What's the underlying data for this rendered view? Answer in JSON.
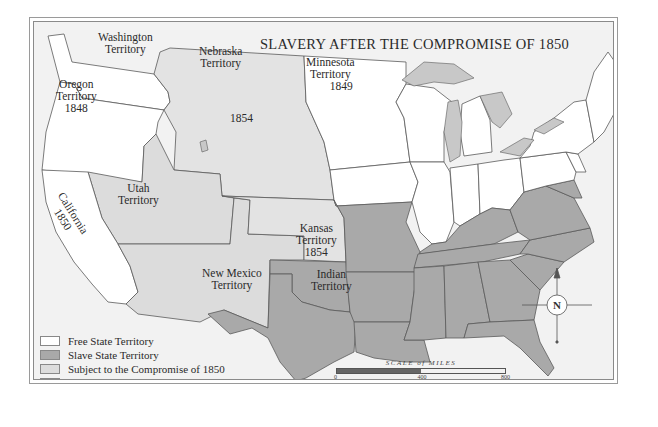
{
  "map": {
    "title": "SLAVERY AFTER THE COMPROMISE OF 1850",
    "colors": {
      "free": "#ffffff",
      "slave": "#a9a9a9",
      "compromise": "#dcdcdc",
      "kansas_nebraska": "#e3e3e3",
      "water": "#f2f2f2",
      "lakes": "#c8c8c8",
      "border": "#5a5a5a"
    },
    "regions": {
      "washington": {
        "name": "Washington",
        "suffix": "Territory"
      },
      "oregon": {
        "name": "Oregon",
        "suffix": "Territory",
        "year": "1848"
      },
      "nebraska": {
        "name": "Nebraska",
        "suffix": "Territory",
        "year": "1854"
      },
      "minnesota": {
        "name": "Minnesota",
        "suffix": "Territory",
        "year": "1849"
      },
      "utah": {
        "name": "Utah",
        "suffix": "Territory"
      },
      "california": {
        "name": "California",
        "year": "1850"
      },
      "kansas": {
        "name": "Kansas",
        "suffix": "Territory",
        "year": "1854"
      },
      "new_mexico": {
        "name": "New Mexico",
        "suffix": "Territory"
      },
      "indian": {
        "name": "Indian",
        "suffix": "Territory"
      }
    },
    "legend": [
      {
        "label": "Free State Territory",
        "color": "#ffffff"
      },
      {
        "label": "Slave State Territory",
        "color": "#a9a9a9"
      },
      {
        "label": "Subject to the Compromise of 1850",
        "color": "#dcdcdc"
      },
      {
        "label": "Subject to the Kansas-Nebraska Act",
        "color": "#e3e3e3"
      }
    ],
    "scale": {
      "title": "SCALE of MILES",
      "ticks": [
        "0",
        "400",
        "800"
      ]
    },
    "compass": {
      "label": "N"
    }
  }
}
